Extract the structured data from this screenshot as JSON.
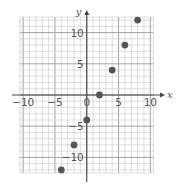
{
  "chart_data": {
    "type": "scatter",
    "title": "",
    "xlabel": "x",
    "ylabel": "y",
    "xlim": [
      -10.5,
      10.5
    ],
    "ylim": [
      -12.5,
      12.5
    ],
    "grid": true,
    "grid_minor_step": 1,
    "grid_major_step": 5,
    "x_ticks": [
      -10,
      -5,
      0,
      5,
      10
    ],
    "x_tick_labels": [
      "−10",
      "−5",
      "0",
      "5",
      "10"
    ],
    "y_ticks": [
      -10,
      -5,
      5,
      10
    ],
    "y_tick_labels": [
      "−10",
      "−5",
      "5",
      "10"
    ],
    "series": [
      {
        "name": "points",
        "x": [
          -4,
          -2,
          0,
          2,
          4,
          6,
          8
        ],
        "y": [
          -12,
          -8,
          -4,
          0,
          4,
          8,
          12
        ]
      }
    ],
    "colors": {
      "point": "#555555",
      "axis": "#444444",
      "grid_minor": "#c8c8c8",
      "grid_major": "#9a9a9a",
      "text": "#555555"
    }
  }
}
